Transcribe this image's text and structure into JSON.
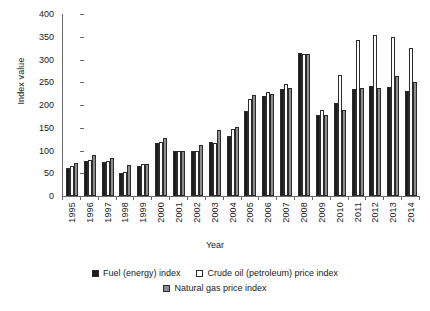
{
  "chart_data": {
    "type": "bar",
    "title": "",
    "xlabel": "Year",
    "ylabel": "Index value",
    "ylim": [
      0,
      400
    ],
    "ytick_step": 50,
    "yticks": [
      400,
      350,
      300,
      250,
      200,
      150,
      100,
      50,
      0
    ],
    "grid": false,
    "legend_position": "bottom",
    "categories": [
      "1995",
      "1996",
      "1997",
      "1998",
      "1999",
      "2000",
      "2001",
      "2002",
      "2003",
      "2004",
      "2005",
      "2006",
      "2007",
      "2008",
      "2009",
      "2010",
      "2011",
      "2012",
      "2013",
      "2014"
    ],
    "series": [
      {
        "name": "Fuel (energy) index",
        "color": "#1c1c1c",
        "values": [
          62,
          76,
          74,
          50,
          67,
          116,
          100,
          98,
          118,
          131,
          187,
          220,
          236,
          315,
          178,
          205,
          236,
          242,
          240,
          230
        ]
      },
      {
        "name": "Crude oil (petroleum) price index",
        "color": "#fdfdfd",
        "values": [
          65,
          79,
          76,
          52,
          70,
          119,
          99,
          99,
          117,
          148,
          213,
          229,
          246,
          312,
          190,
          266,
          342,
          353,
          350,
          325
        ]
      },
      {
        "name": "Natural gas price index",
        "color": "#8e8e8e",
        "values": [
          72,
          90,
          83,
          69,
          70,
          128,
          99,
          112,
          145,
          152,
          222,
          224,
          238,
          313,
          178,
          190,
          238,
          237,
          263,
          250
        ]
      }
    ]
  },
  "legend": {
    "items": [
      {
        "label": "Fuel (energy) index",
        "swatch": "filled-black-square-icon"
      },
      {
        "label": "Crude oil (petroleum) price index",
        "swatch": "open-white-square-icon"
      },
      {
        "label": "Natural gas price index",
        "swatch": "filled-gray-square-icon"
      }
    ]
  }
}
